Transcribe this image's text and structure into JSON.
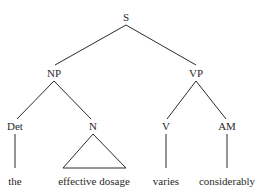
{
  "tree": {
    "nodes": {
      "s": {
        "label": "S",
        "x": 126,
        "y": 21
      },
      "np": {
        "label": "NP",
        "x": 54,
        "y": 77
      },
      "vp": {
        "label": "VP",
        "x": 196,
        "y": 77
      },
      "det": {
        "label": "Det",
        "x": 15,
        "y": 130
      },
      "n": {
        "label": "N",
        "x": 93,
        "y": 130
      },
      "v": {
        "label": "V",
        "x": 166,
        "y": 130
      },
      "am": {
        "label": "AM",
        "x": 227,
        "y": 130
      }
    },
    "leaves": {
      "the": {
        "label": "the",
        "x": 15,
        "y": 185
      },
      "effective_dosage": {
        "label": "effective dosage",
        "x": 94,
        "y": 185
      },
      "varies": {
        "label": "varies",
        "x": 166,
        "y": 185
      },
      "considerably": {
        "label": "considerably",
        "x": 227,
        "y": 185
      }
    }
  }
}
